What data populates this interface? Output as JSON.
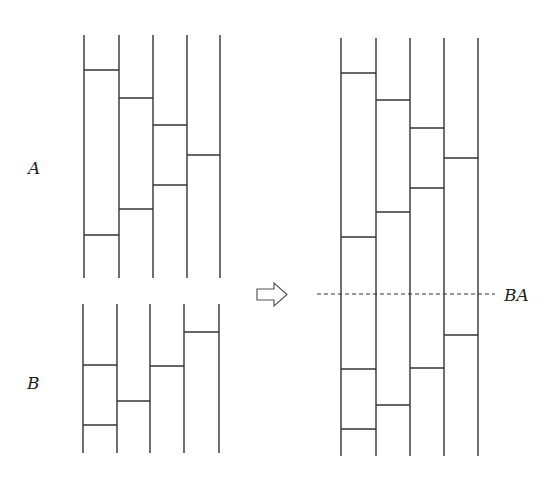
{
  "diagram": {
    "type": "amidakuji-composition",
    "labels": {
      "a": "A",
      "b": "B",
      "composite": "BA"
    },
    "ladder_a": {
      "x": [
        84,
        119,
        153,
        187,
        220
      ],
      "y_top": 35,
      "y_bottom": 278,
      "rungs": [
        {
          "from": 0,
          "to": 1,
          "y": 70
        },
        {
          "from": 1,
          "to": 2,
          "y": 98
        },
        {
          "from": 2,
          "to": 3,
          "y": 125
        },
        {
          "from": 3,
          "to": 4,
          "y": 155
        },
        {
          "from": 2,
          "to": 3,
          "y": 185
        },
        {
          "from": 1,
          "to": 2,
          "y": 209
        },
        {
          "from": 0,
          "to": 1,
          "y": 235
        }
      ]
    },
    "ladder_b": {
      "x": [
        83,
        117,
        150,
        184,
        219
      ],
      "y_top": 304,
      "y_bottom": 453,
      "rungs": [
        {
          "from": 3,
          "to": 4,
          "y": 332
        },
        {
          "from": 0,
          "to": 1,
          "y": 365
        },
        {
          "from": 2,
          "to": 3,
          "y": 366
        },
        {
          "from": 1,
          "to": 2,
          "y": 401
        },
        {
          "from": 0,
          "to": 1,
          "y": 425
        }
      ]
    },
    "ladder_ba": {
      "x": [
        341,
        376,
        410,
        444,
        478
      ],
      "y_top": 38,
      "y_bottom": 456,
      "rungs": [
        {
          "from": 0,
          "to": 1,
          "y": 73
        },
        {
          "from": 1,
          "to": 2,
          "y": 100
        },
        {
          "from": 2,
          "to": 3,
          "y": 128
        },
        {
          "from": 3,
          "to": 4,
          "y": 158
        },
        {
          "from": 2,
          "to": 3,
          "y": 188
        },
        {
          "from": 1,
          "to": 2,
          "y": 212
        },
        {
          "from": 0,
          "to": 1,
          "y": 237
        },
        {
          "from": 3,
          "to": 4,
          "y": 335
        },
        {
          "from": 0,
          "to": 1,
          "y": 369
        },
        {
          "from": 2,
          "to": 3,
          "y": 368
        },
        {
          "from": 1,
          "to": 2,
          "y": 405
        },
        {
          "from": 0,
          "to": 1,
          "y": 429
        }
      ],
      "divider": {
        "x1": 317,
        "x2": 495,
        "y": 294
      }
    },
    "arrow": "right-outline-arrow",
    "colors": {
      "stroke": "#333333",
      "background": "#ffffff"
    }
  }
}
